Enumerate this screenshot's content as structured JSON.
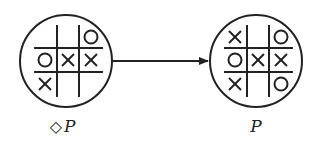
{
  "diagram": {
    "nodes": [
      {
        "id": "left",
        "label": "◇P",
        "label_prefix": "◇",
        "label_var": "P",
        "board": [
          [
            "",
            "",
            "O"
          ],
          [
            "O",
            "X",
            "X"
          ],
          [
            "X",
            "",
            ""
          ]
        ]
      },
      {
        "id": "right",
        "label": "P",
        "label_prefix": "",
        "label_var": "P",
        "board": [
          [
            "X",
            "",
            "O"
          ],
          [
            "O",
            "X",
            "X"
          ],
          [
            "X",
            "",
            "O"
          ]
        ]
      }
    ],
    "edges": [
      {
        "from": "left",
        "to": "right",
        "type": "arrow"
      }
    ],
    "colors": {
      "stroke": "#222222",
      "background": "#ffffff"
    }
  }
}
